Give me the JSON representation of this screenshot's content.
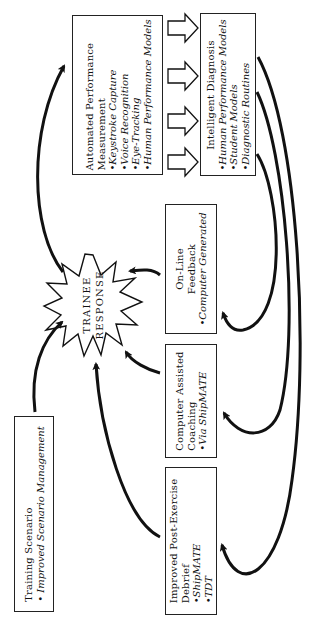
{
  "diagram": {
    "orientation": "rotated -90deg (text reads bottom-to-top)",
    "colors": {
      "line": "#111111",
      "background": "#ffffff"
    },
    "center_node": {
      "label_line1": "TRAINEE",
      "label_line2": "RESPONSE",
      "shape": "starburst"
    },
    "boxes": {
      "automated": {
        "title_line1": "Automated Performance",
        "title_line2": "Measurement",
        "bullets": [
          "•Keystroke Capture",
          "•Voice Recognition",
          "•Eye-Tracking",
          "•Human Performance Models"
        ]
      },
      "diagnosis": {
        "title": "Intelligent Diagnosis",
        "bullets": [
          "•Human Performance Models",
          "•Student Models",
          "•Diagnostic Routines"
        ]
      },
      "feedback": {
        "title_line1": "On-Line",
        "title_line2": "Feedback",
        "bullets": [
          "•Computer Generated"
        ]
      },
      "coaching": {
        "title_line1": "Computer Assisted",
        "title_line2": "Coaching",
        "bullets": [
          "•Via ShipMATE"
        ]
      },
      "debrief": {
        "title_line1": "Improved Post-Exercise",
        "title_line2": "Debrief",
        "bullets": [
          "•ShipMATE",
          "•TDT"
        ]
      },
      "scenario": {
        "title": "Training Scenario",
        "bullets": [
          "• Improved Scenario Management"
        ]
      }
    },
    "block_arrows": {
      "count": 4,
      "from": "automated",
      "to": "diagnosis",
      "icon": "hollow-block-arrow-right"
    },
    "connections": [
      {
        "from": "scenario",
        "to": "center_node"
      },
      {
        "from": "center_node",
        "to": "automated"
      },
      {
        "from": "diagnosis",
        "to": "feedback"
      },
      {
        "from": "diagnosis",
        "to": "coaching"
      },
      {
        "from": "diagnosis",
        "to": "debrief"
      },
      {
        "from": "feedback",
        "to": "center_node"
      },
      {
        "from": "coaching",
        "to": "center_node"
      },
      {
        "from": "debrief",
        "to": "center_node"
      }
    ]
  }
}
